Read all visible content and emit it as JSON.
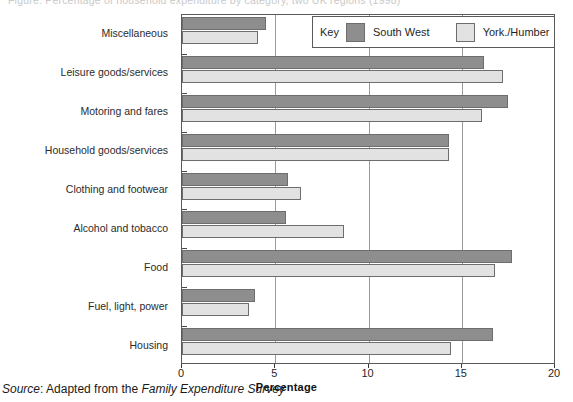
{
  "title": {
    "text": "Figure: Percentage of household expenditure by category, two UK regions (1998)",
    "visible_note": "cut off at top edge"
  },
  "legend": {
    "key_word": "Key",
    "entries": [
      {
        "label": "South West",
        "color": "#8e8e8e",
        "swatch": "dark-grey-swatch"
      },
      {
        "label": "York./Humber",
        "color": "#e2e2e2",
        "swatch": "light-grey-swatch"
      }
    ]
  },
  "axis": {
    "x_title": "Percentage",
    "x_ticks": [
      "0",
      "5",
      "10",
      "15",
      "20"
    ],
    "x_min": 0,
    "x_max": 20
  },
  "source": {
    "lead": "Source",
    "prefix": ": Adapted from the ",
    "italic": "Family Expenditure Survey"
  },
  "chart_data": {
    "type": "bar",
    "orientation": "horizontal",
    "title": "Percentage of household expenditure by category, two UK regions",
    "xlabel": "Percentage",
    "ylabel": "",
    "xlim": [
      0,
      20
    ],
    "grid": true,
    "grid_axis": "x",
    "legend_position": "top-right",
    "categories": [
      "Miscellaneous",
      "Leisure goods/services",
      "Motoring and fares",
      "Household goods/services",
      "Clothing and footwear",
      "Alcohol and tobacco",
      "Food",
      "Fuel, light, power",
      "Housing"
    ],
    "series": [
      {
        "name": "South West",
        "color": "#8e8e8e",
        "values": [
          4.5,
          16.2,
          17.5,
          14.3,
          5.7,
          5.6,
          17.7,
          3.9,
          16.7
        ]
      },
      {
        "name": "York./Humber",
        "color": "#e2e2e2",
        "values": [
          4.1,
          17.2,
          16.1,
          14.3,
          6.4,
          8.7,
          16.8,
          3.6,
          14.4
        ]
      }
    ]
  }
}
